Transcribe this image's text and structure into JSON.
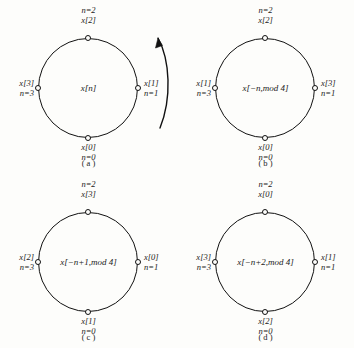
{
  "figure": {
    "background_color": "#fdfdfb",
    "ink_color": "#111111",
    "panels": [
      {
        "caption": "( a )",
        "center_label": "x[n]",
        "top": {
          "n": "n=2",
          "x": "x[2]"
        },
        "right": {
          "x": "x[1]",
          "n": "n=1"
        },
        "bottom": {
          "x": "x[0]",
          "n": "n=0"
        },
        "left": {
          "x": "x[3]",
          "n": "n=3"
        },
        "direction_arrow": "counterclockwise-arrow-icon"
      },
      {
        "caption": "( b )",
        "center_label": "x[−n,mod 4]",
        "top": {
          "n": "n=2",
          "x": "x[2]"
        },
        "right": {
          "x": "x[3]",
          "n": "n=1"
        },
        "bottom": {
          "x": "x[0]",
          "n": "n=0"
        },
        "left": {
          "x": "x[1]",
          "n": "n=3"
        },
        "direction_arrow": ""
      },
      {
        "caption": "( c )",
        "center_label": "x[−n+1,mod 4]",
        "top": {
          "n": "n=2",
          "x": "x[3]"
        },
        "right": {
          "x": "x[0]",
          "n": "n=1"
        },
        "bottom": {
          "x": "x[1]",
          "n": "n=0"
        },
        "left": {
          "x": "x[2]",
          "n": "n=3"
        },
        "direction_arrow": ""
      },
      {
        "caption": "( d )",
        "center_label": "x[−n+2,mod 4]",
        "top": {
          "n": "n=2",
          "x": "x[0]"
        },
        "right": {
          "x": "x[1]",
          "n": "n=1"
        },
        "bottom": {
          "x": "x[2]",
          "n": "n=0"
        },
        "left": {
          "x": "x[3]",
          "n": "n=3"
        },
        "direction_arrow": ""
      }
    ]
  }
}
